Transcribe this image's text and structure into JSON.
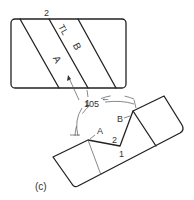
{
  "figure": {
    "caption": "(c)",
    "top_view": {
      "labels": {
        "point_2": "2",
        "true_length": "TL",
        "surface_b": "B",
        "surface_a": "A",
        "point_1": "1"
      }
    },
    "bottom_view": {
      "labels": {
        "angle": "105°",
        "angle_number": "105",
        "surface_b": "B",
        "surface_a": "A",
        "point_2": "2",
        "point_1": "1"
      }
    },
    "colors": {
      "line": "#222222",
      "background": "#ffffff"
    }
  }
}
